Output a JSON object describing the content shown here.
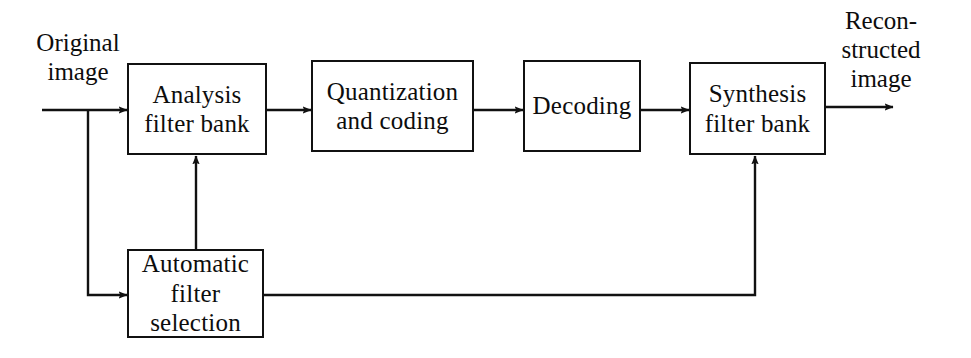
{
  "diagram": {
    "background_color": "#ffffff",
    "stroke_color": "#111111",
    "text_color": "#0d0d0d",
    "labels": {
      "input": {
        "line_1": "Original",
        "line_2": "image"
      },
      "output": {
        "line_1": "Recon-",
        "line_2": "structed",
        "line_3": "image"
      }
    },
    "nodes": [
      {
        "id": "analysis-filter-bank",
        "line_1": "Analysis",
        "line_2": "filter bank",
        "line_3": ""
      },
      {
        "id": "quantization-and-coding",
        "line_1": "Quantization",
        "line_2": "and coding",
        "line_3": ""
      },
      {
        "id": "decoding",
        "line_1": "Decoding",
        "line_2": "",
        "line_3": ""
      },
      {
        "id": "synthesis-filter-bank",
        "line_1": "Synthesis",
        "line_2": "filter bank",
        "line_3": ""
      },
      {
        "id": "automatic-filter-selection",
        "line_1": "Automatic",
        "line_2": "filter",
        "line_3": "selection"
      }
    ],
    "connections": [
      {
        "id": "input-to-analysis",
        "from": "Original image",
        "to": "Analysis filter bank",
        "arrow": true
      },
      {
        "id": "input-branch-to-automatic",
        "from": "Original image",
        "to": "Automatic filter selection",
        "arrow": true
      },
      {
        "id": "analysis-to-quantization",
        "from": "Analysis filter bank",
        "to": "Quantization and coding",
        "arrow": true
      },
      {
        "id": "quantization-to-decoding",
        "from": "Quantization and coding",
        "to": "Decoding",
        "arrow": true
      },
      {
        "id": "decoding-to-synthesis",
        "from": "Decoding",
        "to": "Synthesis filter bank",
        "arrow": true
      },
      {
        "id": "synthesis-to-output",
        "from": "Synthesis filter bank",
        "to": "Reconstructed image",
        "arrow": true
      },
      {
        "id": "automatic-to-analysis",
        "from": "Automatic filter selection",
        "to": "Analysis filter bank",
        "arrow": true
      },
      {
        "id": "automatic-to-synthesis",
        "from": "Automatic filter selection",
        "to": "Synthesis filter bank",
        "arrow": true
      }
    ]
  }
}
